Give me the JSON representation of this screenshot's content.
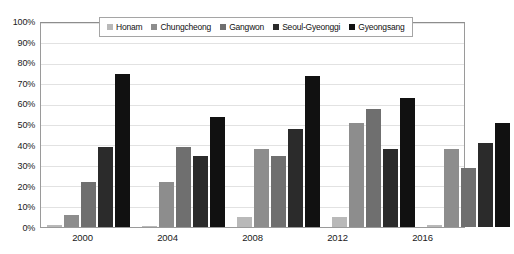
{
  "chart_data": {
    "type": "bar",
    "title": "",
    "subtitle": "",
    "xlabel": "",
    "ylabel": "",
    "categories": [
      "2000",
      "2004",
      "2008",
      "2012",
      "2016"
    ],
    "ylim": [
      0,
      100
    ],
    "y_tick_labels": [
      "0%",
      "10%",
      "20%",
      "30%",
      "40%",
      "50%",
      "60%",
      "70%",
      "80%",
      "90%",
      "100%"
    ],
    "y_tick_values": [
      0,
      10,
      20,
      30,
      40,
      50,
      60,
      70,
      80,
      90,
      100
    ],
    "y_unit": "%",
    "grid": true,
    "legend_position": "top-center",
    "annotations": [],
    "series": [
      {
        "name": "Honam",
        "color": "#b9b9b9",
        "values": [
          1,
          0.5,
          5,
          5,
          1
        ]
      },
      {
        "name": "Chungcheong",
        "color": "#8d8d8d",
        "values": [
          6,
          22,
          38,
          51,
          38
        ]
      },
      {
        "name": "Gangwon",
        "color": "#6f6f6f",
        "values": [
          22,
          39,
          35,
          58,
          29
        ]
      },
      {
        "name": "Seoul-Gyeonggi",
        "color": "#2b2b2b",
        "values": [
          39,
          35,
          48,
          38,
          41
        ]
      },
      {
        "name": "Gyeongsang",
        "color": "#111111",
        "values": [
          75,
          54,
          74,
          63,
          51
        ]
      }
    ]
  }
}
